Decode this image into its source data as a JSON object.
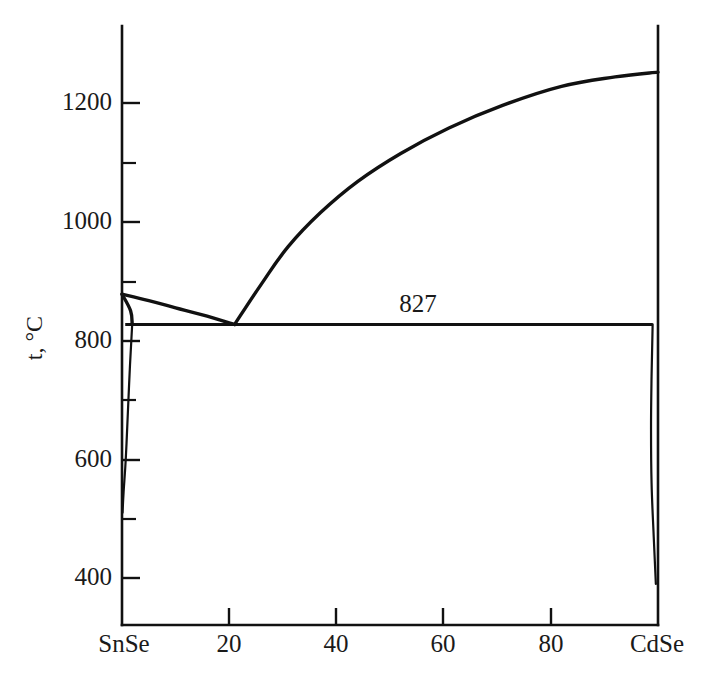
{
  "chart_data": {
    "type": "line",
    "title": "",
    "subtitle": "",
    "xlabel": "",
    "ylabel": "t, °C",
    "xlim": [
      0,
      100
    ],
    "ylim": [
      330,
      1300
    ],
    "grid": false,
    "legend": null,
    "x_axis": {
      "left_end_label": "SnSe",
      "right_end_label": "CdSe",
      "tick_labels": [
        "SnSe",
        "20",
        "40",
        "60",
        "80",
        "CdSe"
      ],
      "tick_values": [
        0,
        20,
        40,
        60,
        80,
        100
      ],
      "units": "mol. %"
    },
    "y_axis": {
      "tick_labels": [
        "400",
        "600",
        "800",
        "1000",
        "1200"
      ],
      "tick_values": [
        400,
        600,
        800,
        1000,
        1200
      ],
      "minor_tick_values": [
        500,
        700,
        900,
        1100
      ],
      "units": "°C"
    },
    "annotations": [
      {
        "text": "827",
        "x": 43,
        "y": 880,
        "name": "eutectic-temperature-label"
      }
    ],
    "key_points": {
      "snse_melting_point": {
        "x": 0,
        "y": 878
      },
      "cdse_liquidus_end": {
        "x": 100,
        "y": 1252
      },
      "eutectic": {
        "x": 21,
        "y": 827
      },
      "eutectic_line_y": 827,
      "snse_solidus_corner": {
        "x": 0,
        "y": 827
      },
      "snse_solvus_bottom": {
        "x": 0,
        "y": 510
      },
      "cdse_solvus_bottom": {
        "x": 100,
        "y": 390
      }
    },
    "series": [
      {
        "name": "liquidus-snse-branch",
        "comment": "Liquidus descending from SnSe melting point to eutectic",
        "points": [
          [
            0,
            878
          ],
          [
            5,
            867
          ],
          [
            10,
            855
          ],
          [
            15,
            843
          ],
          [
            21,
            827
          ]
        ]
      },
      {
        "name": "liquidus-cdse-branch",
        "comment": "Liquidus rising from eutectic to CdSe melting point",
        "points": [
          [
            21,
            827
          ],
          [
            26,
            895
          ],
          [
            31,
            958
          ],
          [
            37,
            1015
          ],
          [
            44,
            1068
          ],
          [
            52,
            1115
          ],
          [
            61,
            1158
          ],
          [
            71,
            1196
          ],
          [
            82,
            1228
          ],
          [
            92,
            1244
          ],
          [
            100,
            1252
          ]
        ]
      },
      {
        "name": "eutectic-horizontal",
        "comment": "Invariant eutectic horizontal at 827 C spanning nearly full width",
        "points": [
          [
            0.6,
            827
          ],
          [
            99,
            827
          ]
        ]
      },
      {
        "name": "snse-solidus",
        "comment": "Short SnSe-rich solidus from melting point down to eutectic plateau",
        "points": [
          [
            0,
            878
          ],
          [
            1.6,
            850
          ],
          [
            1.9,
            827
          ]
        ]
      },
      {
        "name": "snse-solvus",
        "comment": "SnSe-rich solid solubility limit narrowing with falling temperature",
        "points": [
          [
            1.9,
            827
          ],
          [
            1.5,
            760
          ],
          [
            1.1,
            680
          ],
          [
            0.7,
            600
          ],
          [
            0.3,
            545
          ],
          [
            0.1,
            510
          ]
        ]
      },
      {
        "name": "cdse-solvus",
        "comment": "CdSe-rich solid solubility limit near the right axis",
        "points": [
          [
            99,
            827
          ],
          [
            98.8,
            740
          ],
          [
            98.7,
            650
          ],
          [
            98.8,
            560
          ],
          [
            99.2,
            470
          ],
          [
            99.6,
            390
          ]
        ]
      }
    ],
    "phase_regions": [
      "L",
      "L + SnSe ss",
      "L + CdSe ss",
      "SnSe ss + CdSe ss"
    ]
  }
}
